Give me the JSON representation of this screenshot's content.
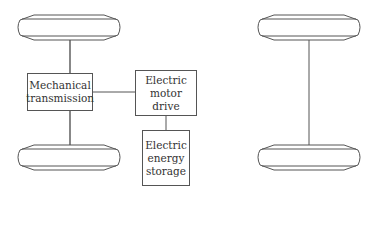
{
  "diagram": {
    "left_vehicle": {
      "blocks": {
        "mechanical_transmission": "Mechanical\ntransmission",
        "electric_motor_drive": "Electric\nmotor\ndrive",
        "electric_energy_storage": "Electric\nenergy\nstorage"
      },
      "wheels": [
        "front-wheel",
        "rear-wheel"
      ]
    },
    "right_vehicle": {
      "wheels": [
        "front-wheel",
        "rear-wheel"
      ]
    },
    "colors": {
      "line": "#555555",
      "background": "#ffffff"
    }
  }
}
